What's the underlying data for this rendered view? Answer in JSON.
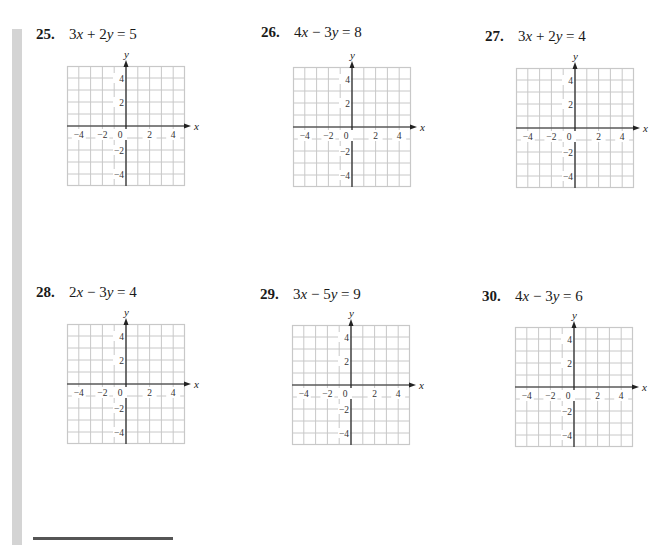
{
  "page": {
    "sidebar_strip_color": "#d4d4d4",
    "grid_line_color": "#c8c8c8",
    "axis_color": "#222222"
  },
  "problems": [
    {
      "number": "25.",
      "equation": "3x + 2y = 5",
      "eq_parts": {
        "a": "3",
        "v1": "x",
        "op": "+",
        "b": "2",
        "v2": "y",
        "rhs": "5"
      }
    },
    {
      "number": "26.",
      "equation": "4x − 3y = 8",
      "eq_parts": {
        "a": "4",
        "v1": "x",
        "op": "−",
        "b": "3",
        "v2": "y",
        "rhs": "8"
      }
    },
    {
      "number": "27.",
      "equation": "3x + 2y = 4",
      "eq_parts": {
        "a": "3",
        "v1": "x",
        "op": "+",
        "b": "2",
        "v2": "y",
        "rhs": "4"
      }
    },
    {
      "number": "28.",
      "equation": "2x − 3y = 4",
      "eq_parts": {
        "a": "2",
        "v1": "x",
        "op": "−",
        "b": "3",
        "v2": "y",
        "rhs": "4"
      }
    },
    {
      "number": "29.",
      "equation": "3x − 5y = 9",
      "eq_parts": {
        "a": "3",
        "v1": "x",
        "op": "−",
        "b": "5",
        "v2": "y",
        "rhs": "9"
      }
    },
    {
      "number": "30.",
      "equation": "4x − 3y = 6",
      "eq_parts": {
        "a": "4",
        "v1": "x",
        "op": "−",
        "b": "3",
        "v2": "y",
        "rhs": "6"
      }
    }
  ],
  "graph": {
    "x_axis_label": "x",
    "y_axis_label": "y",
    "x_tick_labels": [
      "−4",
      "−2",
      "0",
      "2",
      "4"
    ],
    "y_tick_labels": [
      "4",
      "2",
      "−2",
      "−4"
    ],
    "range": [
      -5,
      5
    ],
    "cells": 10
  },
  "chart_data": [
    {
      "type": "table",
      "title": "25. 3x + 2y = 5",
      "xlabel": "x",
      "ylabel": "y",
      "xlim": [
        -5,
        5
      ],
      "ylim": [
        -5,
        5
      ],
      "grid": true,
      "x_ticks": [
        -4,
        -2,
        0,
        2,
        4
      ],
      "y_ticks": [
        -4,
        -2,
        2,
        4
      ]
    },
    {
      "type": "table",
      "title": "26. 4x − 3y = 8",
      "xlabel": "x",
      "ylabel": "y",
      "xlim": [
        -5,
        5
      ],
      "ylim": [
        -5,
        5
      ],
      "grid": true,
      "x_ticks": [
        -4,
        -2,
        0,
        2,
        4
      ],
      "y_ticks": [
        -4,
        -2,
        2,
        4
      ]
    },
    {
      "type": "table",
      "title": "27. 3x + 2y = 4",
      "xlabel": "x",
      "ylabel": "y",
      "xlim": [
        -5,
        5
      ],
      "ylim": [
        -5,
        5
      ],
      "grid": true,
      "x_ticks": [
        -4,
        -2,
        0,
        2,
        4
      ],
      "y_ticks": [
        -4,
        -2,
        2,
        4
      ]
    },
    {
      "type": "table",
      "title": "28. 2x − 3y = 4",
      "xlabel": "x",
      "ylabel": "y",
      "xlim": [
        -5,
        5
      ],
      "ylim": [
        -5,
        5
      ],
      "grid": true,
      "x_ticks": [
        -4,
        -2,
        0,
        2,
        4
      ],
      "y_ticks": [
        -4,
        -2,
        2,
        4
      ]
    },
    {
      "type": "table",
      "title": "29. 3x − 5y = 9",
      "xlabel": "x",
      "ylabel": "y",
      "xlim": [
        -5,
        5
      ],
      "ylim": [
        -5,
        5
      ],
      "grid": true,
      "x_ticks": [
        -4,
        -2,
        0,
        2,
        4
      ],
      "y_ticks": [
        -4,
        -2,
        2,
        4
      ]
    },
    {
      "type": "table",
      "title": "30. 4x − 3y = 6",
      "xlabel": "x",
      "ylabel": "y",
      "xlim": [
        -5,
        5
      ],
      "ylim": [
        -5,
        5
      ],
      "grid": true,
      "x_ticks": [
        -4,
        -2,
        0,
        2,
        4
      ],
      "y_ticks": [
        -4,
        -2,
        2,
        4
      ]
    }
  ]
}
